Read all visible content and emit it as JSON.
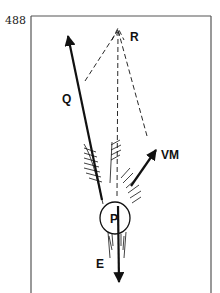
{
  "page": {
    "number": "488"
  },
  "diagram": {
    "labels": {
      "q": "Q",
      "r": "R",
      "vm": "VM",
      "p": "P",
      "e": "E"
    },
    "colors": {
      "ink": "#111111",
      "frame": "#555555",
      "background": "#ffffff"
    }
  }
}
